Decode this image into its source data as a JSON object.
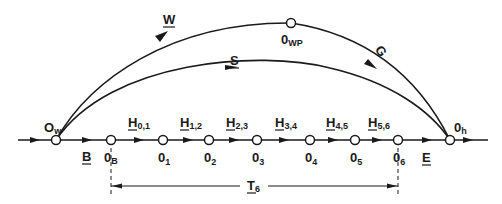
{
  "diagram": {
    "nodes": [
      {
        "id": "Ow",
        "label": "O",
        "sub": "w",
        "x": 56,
        "y": 140,
        "lx": 44,
        "ly": 130
      },
      {
        "id": "OB",
        "label": "0",
        "sub": "B",
        "x": 111,
        "y": 140,
        "lx": 103,
        "ly": 161
      },
      {
        "id": "O1",
        "label": "0",
        "sub": "1",
        "x": 163,
        "y": 140,
        "lx": 157,
        "ly": 161
      },
      {
        "id": "O2",
        "label": "0",
        "sub": "2",
        "x": 209,
        "y": 140,
        "lx": 203,
        "ly": 161
      },
      {
        "id": "O3",
        "label": "0",
        "sub": "3",
        "x": 257,
        "y": 140,
        "lx": 251,
        "ly": 161
      },
      {
        "id": "O4",
        "label": "0",
        "sub": "4",
        "x": 310,
        "y": 140,
        "lx": 304,
        "ly": 161
      },
      {
        "id": "O5",
        "label": "0",
        "sub": "5",
        "x": 355,
        "y": 140,
        "lx": 349,
        "ly": 161
      },
      {
        "id": "O6",
        "label": "0",
        "sub": "6",
        "x": 398,
        "y": 140,
        "lx": 392,
        "ly": 161
      },
      {
        "id": "Oh",
        "label": "0",
        "sub": "h",
        "x": 450,
        "y": 130,
        "lx": 452,
        "ly": 130
      },
      {
        "id": "OWP",
        "label": "0",
        "sub": "WP",
        "x": 291,
        "y": 23,
        "lx": 282,
        "ly": 44
      }
    ],
    "edges": [
      {
        "id": "B",
        "label": "B",
        "sub": "",
        "lx": 83,
        "ly": 161
      },
      {
        "id": "H01",
        "label": "H",
        "sub": "0,1",
        "lx": 128,
        "ly": 126
      },
      {
        "id": "H12",
        "label": "H",
        "sub": "1,2",
        "lx": 180,
        "ly": 126
      },
      {
        "id": "H23",
        "label": "H",
        "sub": "2,3",
        "lx": 226,
        "ly": 126
      },
      {
        "id": "H34",
        "label": "H",
        "sub": "3,4",
        "lx": 275,
        "ly": 126
      },
      {
        "id": "H45",
        "label": "H",
        "sub": "4,5",
        "lx": 326,
        "ly": 126
      },
      {
        "id": "H56",
        "label": "H",
        "sub": "5,6",
        "lx": 368,
        "ly": 126
      },
      {
        "id": "E",
        "label": "E",
        "sub": "",
        "lx": 422,
        "ly": 161
      },
      {
        "id": "W",
        "label": "W",
        "sub": "",
        "lx": 164,
        "ly": 22
      },
      {
        "id": "S",
        "label": "S",
        "sub": "",
        "lx": 229,
        "ly": 65
      },
      {
        "id": "G",
        "label": "G",
        "sub": "",
        "lx": 377,
        "ly": 54
      }
    ],
    "dimension": {
      "label": "T",
      "sub": "6",
      "from": "OB",
      "to": "O6",
      "y": 186
    }
  }
}
